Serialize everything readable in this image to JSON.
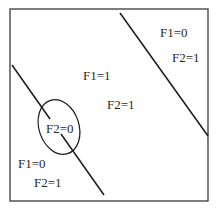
{
  "diagram": {
    "frame": {
      "x": 10,
      "y": 9,
      "width": 198,
      "height": 192,
      "stroke": "#3a3a3a"
    },
    "lines": [
      {
        "name": "right-boundary-line",
        "x1": 120,
        "y1": 13,
        "x2": 208,
        "y2": 136
      },
      {
        "name": "left-boundary-line-upper",
        "x1": 12,
        "y1": 65,
        "x2": 50,
        "y2": 119
      },
      {
        "name": "left-boundary-line-lower",
        "x1": 61,
        "y1": 134,
        "x2": 104,
        "y2": 195
      }
    ],
    "ellipse": {
      "cx": 59,
      "cy": 127,
      "rx": 20,
      "ry": 28,
      "rotate": -18
    },
    "line_color": "#1a1a1a",
    "labels": {
      "top_right_f1": "F1=0",
      "top_right_f2": "F2=1",
      "center_f1": "F1=1",
      "center_f2": "F2=1",
      "ellipse_f2": "F2=0",
      "bottom_left_f1": "F1=0",
      "bottom_left_f2": "F2=1"
    }
  }
}
